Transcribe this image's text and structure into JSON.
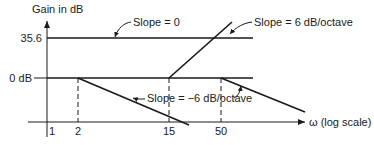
{
  "diagram": {
    "y_axis_label": "Gain in dB",
    "x_axis_label": "ω (log scale)",
    "y_ticks": [
      {
        "label": "35.6"
      },
      {
        "label": "0 dB"
      }
    ],
    "x_ticks": [
      {
        "label": "1"
      },
      {
        "label": "2"
      },
      {
        "label": "15"
      },
      {
        "label": "50"
      }
    ],
    "annotations": {
      "slope_zero": "Slope = 0",
      "slope_pos": "Slope = 6 dB/octave",
      "slope_neg": "Slope = −6 dB/octave"
    },
    "stroke_color": "#1a1a1a"
  }
}
